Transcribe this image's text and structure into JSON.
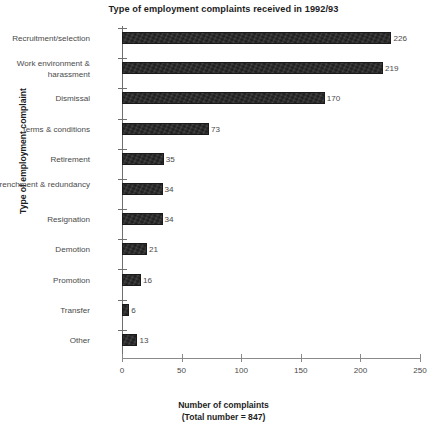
{
  "chart_data": {
    "type": "bar",
    "orientation": "horizontal",
    "title": "Type of employment complaints received in 1992/93",
    "xlabel": "Number of complaints",
    "xlabel_sub": "(Total number = 847)",
    "ylabel": "Type of employment complaint",
    "categories": [
      "Recruitment/selection",
      "Work environment & harassment",
      "Dismissal",
      "Terms & conditions",
      "Retirement",
      "Retrenchment & redundancy",
      "Resignation",
      "Demotion",
      "Promotion",
      "Transfer",
      "Other"
    ],
    "values": [
      226,
      219,
      170,
      73,
      35,
      34,
      34,
      21,
      16,
      6,
      13
    ],
    "value_labels": [
      "226",
      "219",
      "170",
      "73",
      "35",
      "34",
      "34",
      "21",
      "16",
      "6",
      "13"
    ],
    "xlim": [
      0,
      250
    ],
    "xticks": [
      0,
      50,
      100,
      150,
      200,
      250
    ],
    "xtick_labels": [
      "0",
      "50",
      "100",
      "150",
      "200",
      "250"
    ],
    "grid": false,
    "legend": false,
    "total": 847,
    "bar_color": "#262626",
    "axis_color": "#8a8a8a",
    "text_color": "#4a4a4a"
  }
}
